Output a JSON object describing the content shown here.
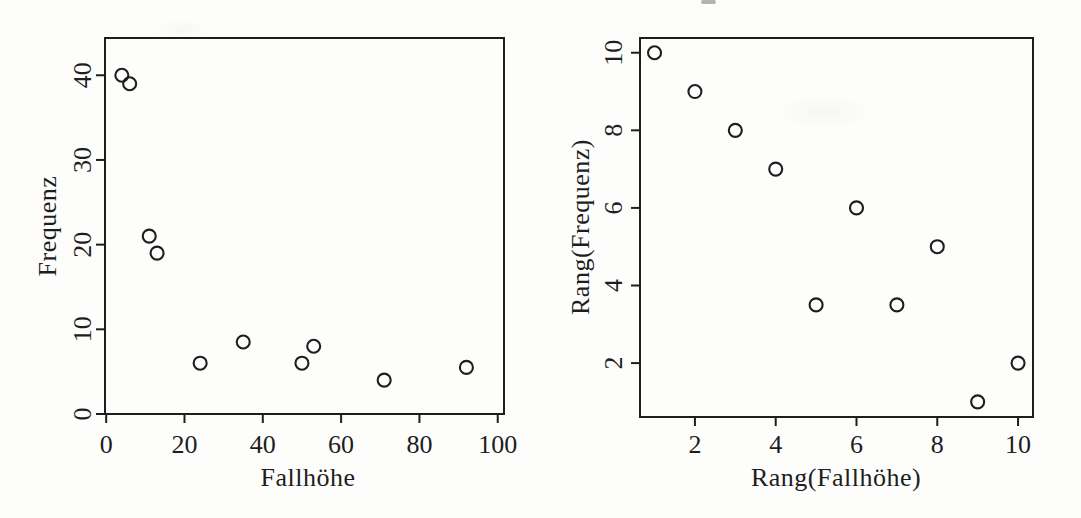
{
  "figure": {
    "background_color": "#fdfdfc",
    "ink_color": "#1e1e1e",
    "marker": "open-circle"
  },
  "chart_data": [
    {
      "type": "scatter",
      "title": "",
      "xlabel": "Fallhöhe",
      "ylabel": "Frequenz",
      "x": [
        4,
        6,
        11,
        13,
        24,
        35,
        50,
        53,
        71,
        92
      ],
      "y": [
        40,
        39,
        21,
        19,
        6,
        8.5,
        6,
        8,
        4,
        5.5
      ],
      "xticks": [
        0,
        20,
        40,
        60,
        80,
        100
      ],
      "yticks": [
        0,
        10,
        20,
        30,
        40
      ],
      "xlim": [
        -0.3,
        101.6
      ],
      "ylim": [
        0,
        44.4
      ],
      "grid": false,
      "legend": "none"
    },
    {
      "type": "scatter",
      "title": "",
      "xlabel": "Rang(Fallhöhe)",
      "ylabel": "Rang(Frequenz)",
      "x": [
        1,
        2,
        3,
        4,
        5,
        6,
        7,
        8,
        9,
        10
      ],
      "y": [
        10,
        9,
        8,
        7,
        3.5,
        6,
        3.5,
        5,
        1,
        2
      ],
      "xticks": [
        2,
        4,
        6,
        8,
        10
      ],
      "yticks": [
        2,
        4,
        6,
        8,
        10
      ],
      "xlim": [
        0.64,
        10.37
      ],
      "ylim": [
        0.61,
        10.38
      ],
      "grid": false,
      "legend": "none"
    }
  ]
}
